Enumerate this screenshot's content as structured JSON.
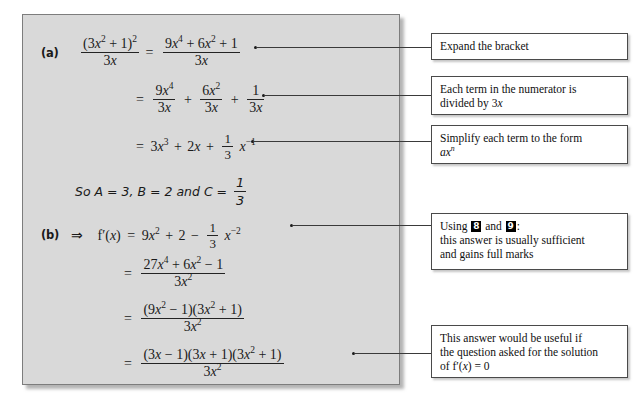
{
  "panel": {
    "part_a": {
      "label": "(a)",
      "lines": [
        {
          "id": "a1",
          "lhs_num": "(3x² + 1)²",
          "lhs_den": "3x",
          "rhs_num": "9x⁴ + 6x² + 1",
          "rhs_den": "3x"
        },
        {
          "id": "a2",
          "text": "= 9x⁴/3x + 6x²/3x + 1/3x"
        },
        {
          "id": "a3",
          "text": "= 3x³ + 2x + (1/3)x⁻¹"
        }
      ],
      "statement": "So A = 3, B = 2 and C = 1/3"
    },
    "part_b": {
      "label": "(b)",
      "implies": "⇒",
      "function": "f′(x)",
      "lines": [
        {
          "id": "b1",
          "text": "= 9x² + 2 − (1/3)x⁻²"
        },
        {
          "id": "b2",
          "num": "27x⁴ + 6x² − 1",
          "den": "3x²"
        },
        {
          "id": "b3",
          "num": "(9x² − 1)(3x² + 1)",
          "den": "3x²"
        },
        {
          "id": "b4",
          "num": "(3x − 1)(3x + 1)(3x² + 1)",
          "den": "3x²"
        }
      ]
    }
  },
  "callouts": [
    {
      "id": "callout-expand",
      "lines": [
        "Expand the bracket"
      ]
    },
    {
      "id": "callout-divide",
      "lines": [
        "Each term in the numerator is",
        "divided by 3x"
      ]
    },
    {
      "id": "callout-simplify",
      "lines": [
        "Simplify each term to the form",
        "axⁿ"
      ]
    },
    {
      "id": "callout-using",
      "using_prefix": "Using",
      "badge_1": "8",
      "conjunction": "and",
      "badge_2": "9",
      "colon": ":",
      "lines": [
        "this answer is usually sufficient",
        "and gains full marks"
      ]
    },
    {
      "id": "callout-factorised",
      "lines": [
        "This answer would be useful if",
        "the question asked for the solution",
        "of f′(x) = 0"
      ]
    }
  ],
  "symbols": {
    "equals": "=",
    "plus": "+",
    "minus": "−",
    "three_x": "3x",
    "three_x_sq": "3x²",
    "one": "1",
    "three": "3",
    "nine_x4": "9x⁴",
    "six_x2": "6x²"
  },
  "colors": {
    "panel_bg": "#d9d9d9",
    "panel_border": "#7d7d7d",
    "page_bg": "#ffffff",
    "ink": "#1a1a1a",
    "badge_bg": "#000000",
    "badge_text": "#ffffff",
    "connector": "#3a3a3a"
  }
}
